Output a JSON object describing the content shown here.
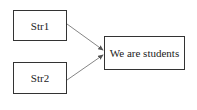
{
  "diagram": {
    "nodes": [
      {
        "id": "str1",
        "label": "Str1"
      },
      {
        "id": "str2",
        "label": "Str2"
      },
      {
        "id": "result",
        "label": "We are students"
      }
    ],
    "edges": [
      {
        "from": "str1",
        "to": "result"
      },
      {
        "from": "str2",
        "to": "result"
      }
    ]
  }
}
